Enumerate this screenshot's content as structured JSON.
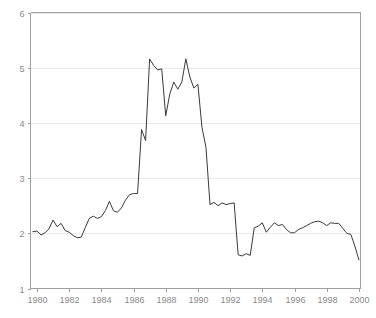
{
  "chart_data": {
    "type": "line",
    "title": "",
    "subtitle": "",
    "xlabel": "",
    "ylabel": "",
    "xlim": [
      1979.6,
      2000.1
    ],
    "ylim": [
      1,
      6
    ],
    "grid": true,
    "grid_axis": "y",
    "legend": false,
    "legend_position": "none",
    "line_color": "#3a3a3a",
    "grid_color": "#eaeaea",
    "axis_color": "#a0a0a0",
    "tick_label_color": "#8a8a8a",
    "background_color": "#ffffff",
    "xticks": [
      1980,
      1982,
      1984,
      1986,
      1988,
      1990,
      1992,
      1994,
      1996,
      1998,
      2000
    ],
    "xtick_labels": [
      "1980",
      "1982",
      "1984",
      "1986",
      "1988",
      "1990",
      "1992",
      "1994",
      "1996",
      "1998",
      "2000"
    ],
    "yticks": [
      1,
      2,
      3,
      4,
      5,
      6
    ],
    "ytick_labels": [
      "1",
      "2",
      "3",
      "4",
      "5",
      "6"
    ],
    "series": [
      {
        "name": "series-1",
        "x": [
          1979.75,
          1980.0,
          1980.25,
          1980.5,
          1980.75,
          1981.0,
          1981.25,
          1981.5,
          1981.75,
          1982.0,
          1982.25,
          1982.5,
          1982.75,
          1983.0,
          1983.25,
          1983.5,
          1983.75,
          1984.0,
          1984.25,
          1984.5,
          1984.75,
          1985.0,
          1985.25,
          1985.5,
          1985.75,
          1986.0,
          1986.25,
          1986.5,
          1986.75,
          1987.0,
          1987.25,
          1987.5,
          1987.75,
          1988.0,
          1988.25,
          1988.5,
          1988.75,
          1989.0,
          1989.25,
          1989.5,
          1989.75,
          1990.0,
          1990.25,
          1990.5,
          1990.75,
          1991.0,
          1991.25,
          1991.5,
          1991.75,
          1992.0,
          1992.25,
          1992.5,
          1992.75,
          1993.0,
          1993.25,
          1993.5,
          1993.75,
          1994.0,
          1994.25,
          1994.5,
          1994.75,
          1995.0,
          1995.25,
          1995.5,
          1995.75,
          1996.0,
          1996.25,
          1996.5,
          1996.75,
          1997.0,
          1997.25,
          1997.5,
          1997.75,
          1998.0,
          1998.25,
          1998.5,
          1998.75,
          1999.0,
          1999.25,
          1999.5,
          1999.75,
          2000.0
        ],
        "values": [
          2.03,
          2.04,
          1.97,
          2.01,
          2.08,
          2.24,
          2.12,
          2.18,
          2.05,
          2.02,
          1.96,
          1.92,
          1.93,
          2.1,
          2.27,
          2.31,
          2.27,
          2.3,
          2.41,
          2.58,
          2.41,
          2.38,
          2.46,
          2.6,
          2.7,
          2.72,
          2.72,
          3.88,
          3.68,
          5.16,
          5.04,
          4.96,
          4.98,
          4.13,
          4.52,
          4.74,
          4.61,
          4.74,
          5.16,
          4.83,
          4.63,
          4.7,
          3.92,
          3.56,
          2.52,
          2.56,
          2.5,
          2.55,
          2.52,
          2.54,
          2.55,
          1.61,
          1.59,
          1.63,
          1.6,
          2.1,
          2.13,
          2.19,
          2.02,
          2.11,
          2.19,
          2.14,
          2.16,
          2.07,
          2.01,
          2.01,
          2.07,
          2.1,
          2.14,
          2.18,
          2.21,
          2.22,
          2.19,
          2.14,
          2.19,
          2.18,
          2.18,
          2.09,
          2.0,
          1.98,
          1.77,
          1.52
        ]
      }
    ]
  },
  "axes": {
    "y_axis_name": "y-axis",
    "x_axis_name": "x-axis"
  }
}
